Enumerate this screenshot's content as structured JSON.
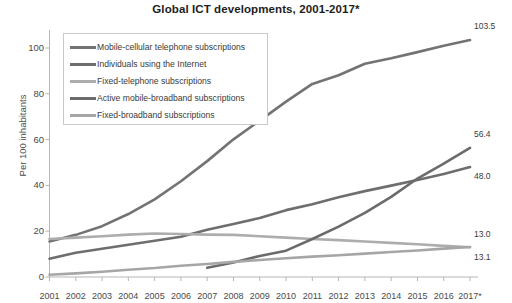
{
  "chart_data": {
    "type": "line",
    "title": "Global ICT developments, 2001-2017*",
    "xlabel": "",
    "ylabel": "Per 100 inhabitants",
    "ylim": [
      0,
      110
    ],
    "yticks": [
      0,
      20,
      40,
      60,
      80,
      100
    ],
    "grid": false,
    "legend_position": "upper-left-inside",
    "categories": [
      "2001",
      "2002",
      "2003",
      "2004",
      "2005",
      "2006",
      "2007",
      "2008",
      "2009",
      "2010",
      "2011",
      "2012",
      "2013",
      "2014",
      "2015",
      "2016",
      "2017*"
    ],
    "series": [
      {
        "name": "Mobile-cellular telephone subscriptions",
        "color": "#737373",
        "end_label": "103.5",
        "values": [
          15.5,
          18.4,
          22.2,
          27.5,
          33.9,
          41.8,
          50.6,
          60.1,
          68.3,
          76.6,
          84.3,
          88.1,
          93.1,
          95.5,
          98.2,
          101.0,
          103.5
        ]
      },
      {
        "name": "Individuals using the Internet",
        "color": "#6e6e6e",
        "end_label": "48.0",
        "values": [
          8.0,
          10.6,
          12.3,
          14.1,
          15.8,
          17.6,
          20.6,
          23.1,
          25.8,
          29.2,
          31.8,
          34.8,
          37.5,
          39.9,
          42.4,
          45.0,
          48.0
        ]
      },
      {
        "name": "Fixed-telephone subscriptions",
        "color": "#adadad",
        "end_label": "13.0",
        "values": [
          16.6,
          17.2,
          17.8,
          18.5,
          19.0,
          18.8,
          18.5,
          18.4,
          17.8,
          17.2,
          16.6,
          16.1,
          15.5,
          14.9,
          14.3,
          13.6,
          13.0
        ]
      },
      {
        "name": "Active mobile-broadband subscriptions",
        "color": "#6b6b6b",
        "end_label": "56.4",
        "values": [
          null,
          null,
          null,
          null,
          null,
          null,
          4.0,
          6.3,
          9.2,
          11.5,
          16.6,
          22.0,
          28.0,
          35.0,
          43.0,
          49.5,
          56.4
        ]
      },
      {
        "name": "Fixed-broadband subscriptions",
        "color": "#a6a6a6",
        "end_label": "13.1",
        "values": [
          1.0,
          1.6,
          2.3,
          3.2,
          3.9,
          4.9,
          5.7,
          6.6,
          7.4,
          8.2,
          8.9,
          9.5,
          10.2,
          10.9,
          11.6,
          12.4,
          13.1
        ]
      }
    ]
  },
  "axis": {
    "y_tick_labels": [
      "0",
      "20",
      "40",
      "60",
      "80",
      "100"
    ],
    "x_tick_labels": [
      "2001",
      "2002",
      "2003",
      "2004",
      "2005",
      "2006",
      "2007",
      "2008",
      "2009",
      "2010",
      "2011",
      "2012",
      "2013",
      "2014",
      "2015",
      "2016",
      "2017*"
    ]
  }
}
